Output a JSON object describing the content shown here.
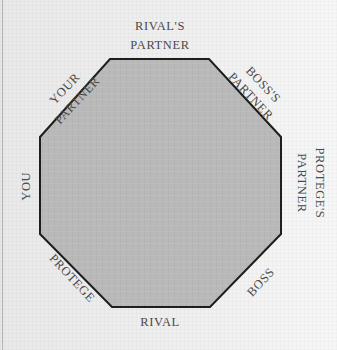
{
  "diagram": {
    "type": "seating-octagon",
    "shape_fill": "#b9b9b9",
    "shape_stroke": "#1e1e1e",
    "text_color": "#4a4a4a",
    "top_fragment": "",
    "seats": [
      {
        "id": "rivals-partner",
        "line1": "RIVAL'S",
        "line2": "PARTNER",
        "position": "top"
      },
      {
        "id": "boss-partner",
        "line1": "BOSS'S",
        "line2": "PARTNER",
        "position": "top-right"
      },
      {
        "id": "protege-partner",
        "line1": "PROTEGE'S",
        "line2": "PARTNER",
        "position": "right"
      },
      {
        "id": "boss",
        "line1": "BOSS",
        "position": "bottom-right"
      },
      {
        "id": "rival",
        "line1": "RIVAL",
        "position": "bottom"
      },
      {
        "id": "protege",
        "line1": "PROTEGE",
        "position": "bottom-left"
      },
      {
        "id": "you",
        "line1": "YOU",
        "position": "left"
      },
      {
        "id": "your-partner",
        "line1": "YOUR",
        "line2": "PARTNER",
        "position": "top-left"
      }
    ]
  }
}
